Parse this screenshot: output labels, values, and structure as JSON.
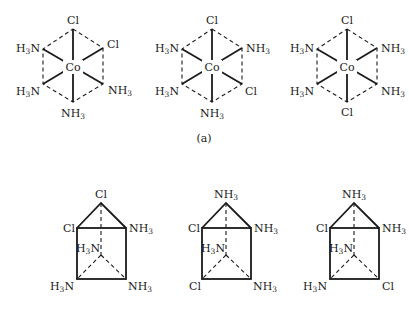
{
  "figure": {
    "caption_a": "(a)",
    "octahedra": [
      {
        "name": "octahedral-isomer-1",
        "center": "Co",
        "ligands": {
          "top": "Cl",
          "upper_left": "H3N",
          "upper_right": "Cl",
          "lower_left": "H3N",
          "lower_right": "NH3",
          "bottom": "NH3"
        }
      },
      {
        "name": "octahedral-isomer-2",
        "center": "Co",
        "ligands": {
          "top": "Cl",
          "upper_left": "H3N",
          "upper_right": "NH3",
          "lower_left": "H3N",
          "lower_right": "Cl",
          "bottom": "NH3"
        }
      },
      {
        "name": "octahedral-isomer-3",
        "center": "Co",
        "ligands": {
          "top": "Cl",
          "upper_left": "H3N",
          "upper_right": "NH3",
          "lower_left": "H3N",
          "lower_right": "NH3",
          "bottom": "Cl"
        }
      }
    ],
    "prisms": [
      {
        "name": "trigonal-prism-isomer-1",
        "ligands": {
          "apex": "Cl",
          "top_left": "Cl",
          "top_right": "NH3",
          "back": "H3N",
          "bottom_left": "H3N",
          "bottom_right": "NH3"
        }
      },
      {
        "name": "trigonal-prism-isomer-2",
        "ligands": {
          "apex": "NH3",
          "top_left": "Cl",
          "top_right": "NH3",
          "back": "H3N",
          "bottom_left": "Cl",
          "bottom_right": "NH3"
        }
      },
      {
        "name": "trigonal-prism-isomer-3",
        "ligands": {
          "apex": "NH3",
          "top_left": "Cl",
          "top_right": "NH3",
          "back": "H3N",
          "bottom_left": "H3N",
          "bottom_right": "Cl"
        }
      }
    ]
  }
}
